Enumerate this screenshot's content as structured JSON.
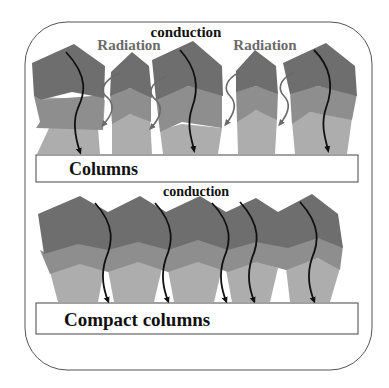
{
  "diagram": {
    "colors": {
      "dark": "#6e6e6e",
      "mid": "#8e8e8e",
      "light": "#adadad",
      "arrow_conduction": "#111111",
      "arrow_radiation": "#6a6a6a",
      "label_radiation": "#6a6a6a",
      "label_conduction": "#111111",
      "frame": "#555555"
    },
    "top_panel": {
      "conduction_label": "conduction",
      "radiation_labels": [
        "Radiation",
        "Radiation"
      ],
      "box_label": "Columns",
      "column_count": 5
    },
    "bottom_panel": {
      "conduction_label": "conduction",
      "box_label": "Compact columns",
      "column_count": 5
    }
  }
}
